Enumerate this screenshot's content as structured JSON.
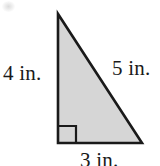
{
  "figure": {
    "type": "right-triangle-diagram",
    "background_color": "#ffffff",
    "fill_color": "#d6d6d6",
    "stroke_color": "#1a1a1a",
    "text_color": "#1a1a1a",
    "labels": {
      "left_leg": "4 in.",
      "hypotenuse": "5 in.",
      "bottom_leg": "3 in."
    },
    "geometry": {
      "apex": {
        "x": 58,
        "y": 14
      },
      "bottom_left": {
        "x": 58,
        "y": 143
      },
      "bottom_right": {
        "x": 142,
        "y": 143
      },
      "right_angle_marker": {
        "x": 59,
        "y": 126,
        "size": 17
      }
    }
  }
}
